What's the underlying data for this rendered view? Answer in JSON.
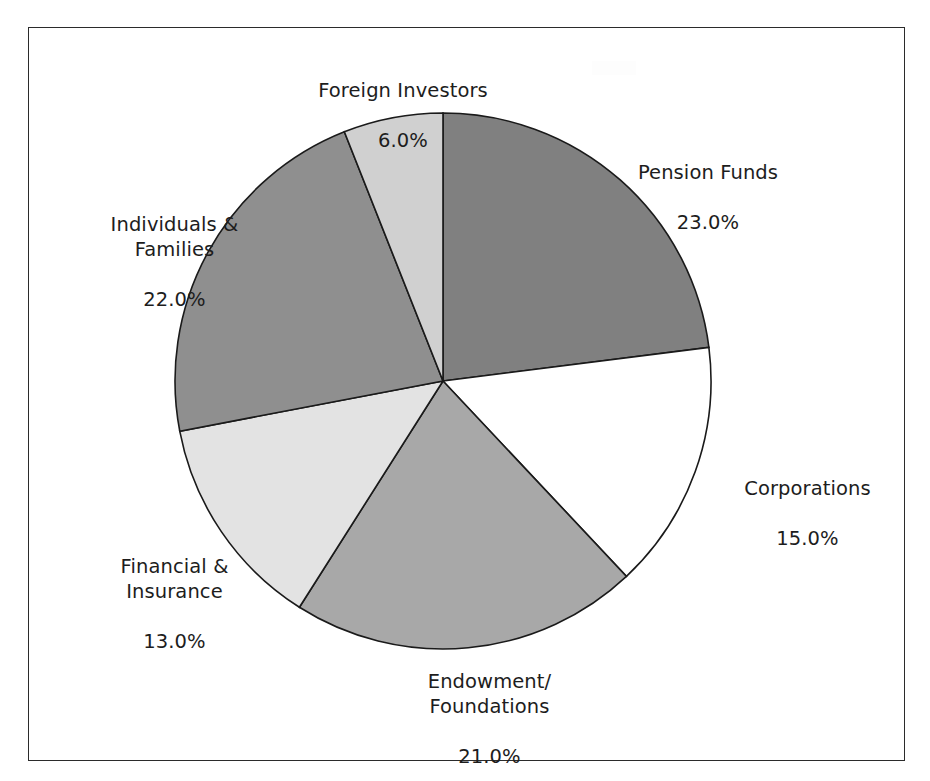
{
  "figure": {
    "background_color": "#ffffff",
    "border_color": "#2b2b2b"
  },
  "chart_data": {
    "type": "pie",
    "title": "",
    "subtitle": "",
    "xlabel": "",
    "ylabel": "",
    "legend_position": "none",
    "grid": false,
    "start_angle_deg": 90,
    "direction": "clockwise",
    "label_format": "name + percent",
    "categories": [
      "Pension Funds",
      "Corporations",
      "Endowment/\nFoundations",
      "Financial &\nInsurance",
      "Individuals &\nFamilies",
      "Foreign Investors"
    ],
    "values": [
      23.0,
      15.0,
      21.0,
      13.0,
      22.0,
      6.0
    ],
    "value_labels": [
      "23.0%",
      "15.0%",
      "21.0%",
      "13.0%",
      "22.0%",
      "6.0%"
    ],
    "colors": [
      "#808080",
      "#ffffff",
      "#a8a8a8",
      "#e3e3e3",
      "#8f8f8f",
      "#d0d0d0"
    ],
    "slices": [
      {
        "name": "Pension Funds",
        "name_lines": [
          "Pension Funds"
        ],
        "value": 23.0,
        "value_label": "23.0%",
        "color": "#808080"
      },
      {
        "name": "Corporations",
        "name_lines": [
          "Corporations"
        ],
        "value": 15.0,
        "value_label": "15.0%",
        "color": "#ffffff"
      },
      {
        "name": "Endowment/Foundations",
        "name_lines": [
          "Endowment/",
          "Foundations"
        ],
        "value": 21.0,
        "value_label": "21.0%",
        "color": "#a8a8a8"
      },
      {
        "name": "Financial & Insurance",
        "name_lines": [
          "Financial &",
          "Insurance"
        ],
        "value": 13.0,
        "value_label": "13.0%",
        "color": "#e3e3e3"
      },
      {
        "name": "Individuals & Families",
        "name_lines": [
          "Individuals &",
          "Families"
        ],
        "value": 22.0,
        "value_label": "22.0%",
        "color": "#8f8f8f"
      },
      {
        "name": "Foreign Investors",
        "name_lines": [
          "Foreign Investors"
        ],
        "value": 6.0,
        "value_label": "6.0%",
        "color": "#d0d0d0"
      }
    ]
  },
  "labels": {
    "pension_funds": {
      "name": "Pension Funds",
      "value": "23.0%"
    },
    "corporations": {
      "name": "Corporations",
      "value": "15.0%"
    },
    "endowment": {
      "name": "Endowment/\nFoundations",
      "value": "21.0%"
    },
    "financial": {
      "name": "Financial &\nInsurance",
      "value": "13.0%"
    },
    "individuals": {
      "name": "Individuals &\nFamilies",
      "value": "22.0%"
    },
    "foreign_investors": {
      "name": "Foreign Investors",
      "value": "6.0%"
    }
  }
}
